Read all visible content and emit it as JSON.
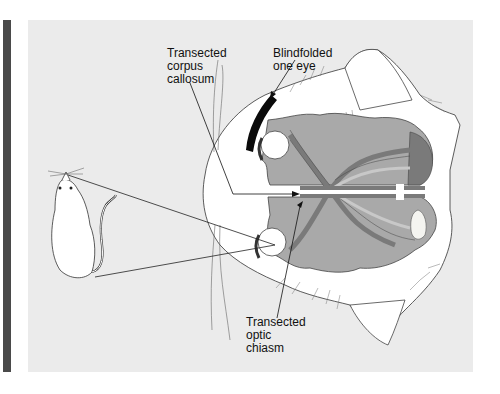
{
  "figure": {
    "labels": {
      "corpus_callosum": "Transected\ncorpus\ncallosum",
      "blindfold": "Blindfolded\none eye",
      "optic_chiasm": "Transected\noptic\nchiasm"
    },
    "colors": {
      "panel_bg": "#ebebeb",
      "side_bar": "#4a4a4a",
      "brain_light": "#a9a9a9",
      "brain_dark": "#7a7a7a",
      "fur": "#ffffff",
      "blindfold": "#0a0a0a",
      "lines": "#222222"
    },
    "subjects": [
      "rat",
      "cat"
    ]
  }
}
